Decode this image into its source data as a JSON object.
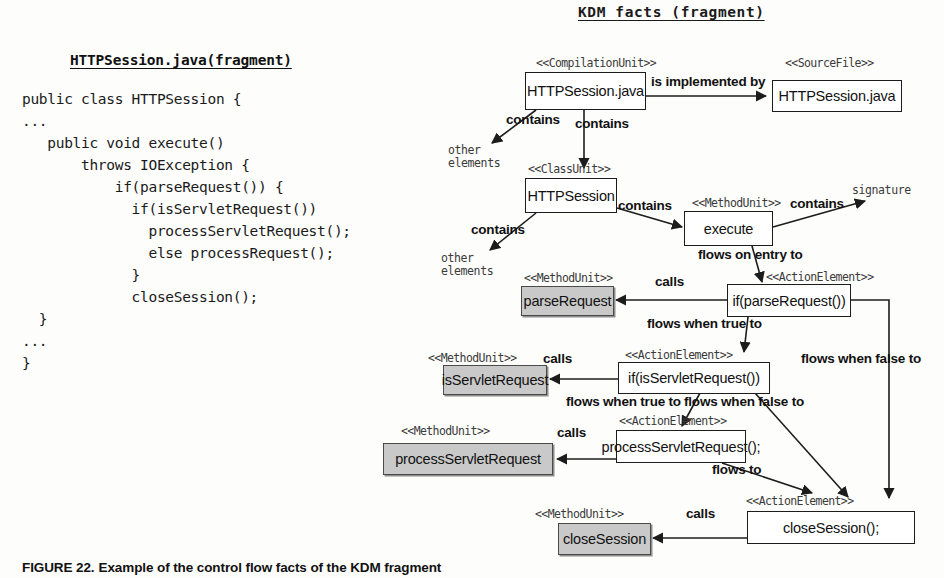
{
  "code_panel": {
    "title": "HTTPSession.java(fragment)",
    "source": "public class HTTPSession {\n...\n   public void execute()\n       throws IOException {\n           if(parseRequest()) {\n             if(isServletRequest())\n               processServletRequest();\n               else processRequest();\n             }\n             closeSession();\n  }\n...\n}"
  },
  "diagram": {
    "title": "KDM facts (fragment)",
    "nodes": [
      {
        "id": "compilation-unit",
        "label": "HTTPSession.java",
        "stereotype": "<<CompilationUnit>>",
        "shaded": false
      },
      {
        "id": "source-file",
        "label": "HTTPSession.java",
        "stereotype": "<<SourceFile>>",
        "shaded": false
      },
      {
        "id": "class-unit",
        "label": "HTTPSession",
        "stereotype": "<<ClassUnit>>",
        "shaded": false
      },
      {
        "id": "method-execute",
        "label": "execute",
        "stereotype": "<<MethodUnit>>",
        "shaded": false
      },
      {
        "id": "method-parse-request",
        "label": "parseRequest",
        "stereotype": "<<MethodUnit>>",
        "shaded": true
      },
      {
        "id": "action-if-parse-request",
        "label": "if(parseRequest())",
        "stereotype": "<<ActionElement>>",
        "shaded": false
      },
      {
        "id": "method-is-servlet-request",
        "label": "isServletRequest",
        "stereotype": "<<MethodUnit>>",
        "shaded": true
      },
      {
        "id": "action-if-is-servlet-request",
        "label": "if(isServletRequest())",
        "stereotype": "<<ActionElement>>",
        "shaded": false
      },
      {
        "id": "method-process-servlet-request",
        "label": "processServletRequest",
        "stereotype": "<<MethodUnit>>",
        "shaded": true
      },
      {
        "id": "action-process-servlet-request",
        "label": "processServletRequest();",
        "stereotype": "<<ActionElement>>",
        "shaded": false
      },
      {
        "id": "method-close-session",
        "label": "closeSession",
        "stereotype": "<<MethodUnit>>",
        "shaded": true
      },
      {
        "id": "action-close-session",
        "label": "closeSession();",
        "stereotype": "<<ActionElement>>",
        "shaded": false
      }
    ],
    "terminals": [
      {
        "id": "other-elements-1",
        "label": "other\nelements"
      },
      {
        "id": "other-elements-2",
        "label": "other\nelements"
      },
      {
        "id": "signature",
        "label": "signature"
      }
    ],
    "edges": [
      {
        "id": "is-implemented-by",
        "label": "is implemented by",
        "from": "compilation-unit",
        "to": "source-file"
      },
      {
        "id": "contains-other-1",
        "label": "contains",
        "from": "compilation-unit",
        "to": "other-elements-1"
      },
      {
        "id": "contains-class-unit",
        "label": "contains",
        "from": "compilation-unit",
        "to": "class-unit"
      },
      {
        "id": "contains-other-2",
        "label": "contains",
        "from": "class-unit",
        "to": "other-elements-2"
      },
      {
        "id": "contains-method-execute",
        "label": "contains",
        "from": "class-unit",
        "to": "method-execute"
      },
      {
        "id": "contains-signature",
        "label": "contains",
        "from": "method-execute",
        "to": "signature"
      },
      {
        "id": "flows-on-entry-to",
        "label": "flows on entry to",
        "from": "method-execute",
        "to": "action-if-parse-request"
      },
      {
        "id": "calls-parse-request",
        "label": "calls",
        "from": "action-if-parse-request",
        "to": "method-parse-request"
      },
      {
        "id": "flows-when-true-1",
        "label": "flows when true to",
        "from": "action-if-parse-request",
        "to": "action-if-is-servlet-request"
      },
      {
        "id": "flows-when-false-1",
        "label": "flows when false to",
        "from": "action-if-parse-request",
        "to": "action-close-session"
      },
      {
        "id": "calls-is-servlet-request",
        "label": "calls",
        "from": "action-if-is-servlet-request",
        "to": "method-is-servlet-request"
      },
      {
        "id": "flows-when-true-2",
        "label": "flows when true to",
        "from": "action-if-is-servlet-request",
        "to": "action-process-servlet-request"
      },
      {
        "id": "flows-when-false-2",
        "label": "flows when false to",
        "from": "action-if-is-servlet-request",
        "to": "action-close-session"
      },
      {
        "id": "calls-process-servlet-request",
        "label": "calls",
        "from": "action-process-servlet-request",
        "to": "method-process-servlet-request"
      },
      {
        "id": "flows-to",
        "label": "flows to",
        "from": "action-process-servlet-request",
        "to": "action-close-session"
      },
      {
        "id": "calls-close-session",
        "label": "calls",
        "from": "action-close-session",
        "to": "method-close-session"
      }
    ]
  },
  "caption": {
    "number": "FIGURE 22.",
    "text": "Example of the control flow facts of the KDM fragment"
  },
  "colors": {
    "shaded_fill": "#c9c9c9",
    "stroke": "#1c1c1c",
    "page_background": "#fdfdfc"
  }
}
